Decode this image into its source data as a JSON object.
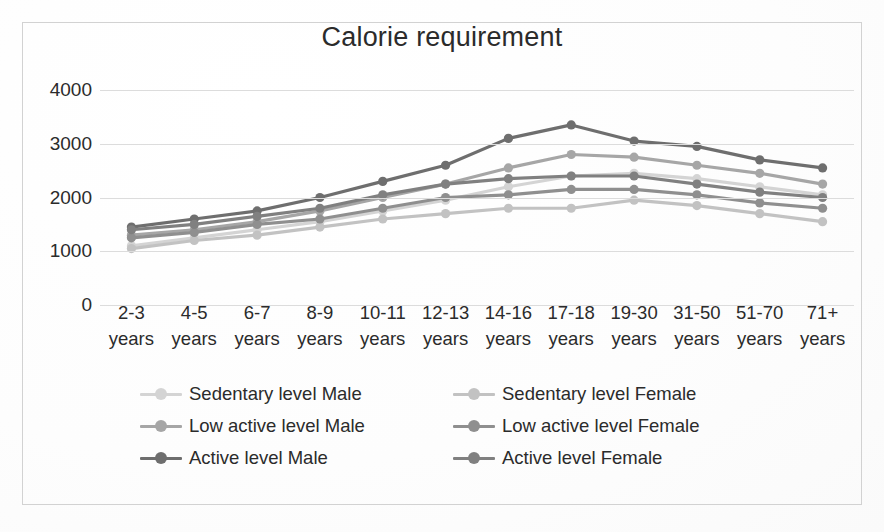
{
  "chart_title": "Calorie requirement",
  "axis": {
    "y_ticks": [
      "4000",
      "3000",
      "2000",
      "1000",
      "0"
    ],
    "x_categories": [
      {
        "l1": "2-3",
        "l2": "years"
      },
      {
        "l1": "4-5",
        "l2": "years"
      },
      {
        "l1": "6-7",
        "l2": "years"
      },
      {
        "l1": "8-9",
        "l2": "years"
      },
      {
        "l1": "10-11",
        "l2": "years"
      },
      {
        "l1": "12-13",
        "l2": "years"
      },
      {
        "l1": "14-16",
        "l2": "years"
      },
      {
        "l1": "17-18",
        "l2": "years"
      },
      {
        "l1": "19-30",
        "l2": "years"
      },
      {
        "l1": "31-50",
        "l2": "years"
      },
      {
        "l1": "51-70",
        "l2": "years"
      },
      {
        "l1": "71+",
        "l2": "years"
      }
    ]
  },
  "legend": {
    "position": "bottom",
    "items": [
      {
        "label": "Sedentary level Male",
        "color": "#d4d4d4"
      },
      {
        "label": "Sedentary level Female",
        "color": "#c2c2c2"
      },
      {
        "label": "Low active level Male",
        "color": "#a6a6a6"
      },
      {
        "label": "Low active level Female",
        "color": "#8f8f8f"
      },
      {
        "label": "Active level Male",
        "color": "#6e6e6e"
      },
      {
        "label": "Active level Female",
        "color": "#808080"
      }
    ]
  },
  "chart_data": {
    "type": "line",
    "title": "Calorie requirement",
    "xlabel": "",
    "ylabel": "",
    "ylim": [
      0,
      4000
    ],
    "ytick_step": 1000,
    "grid": true,
    "legend_position": "bottom",
    "markers": true,
    "categories": [
      "2-3 years",
      "4-5 years",
      "6-7 years",
      "8-9 years",
      "10-11 years",
      "12-13 years",
      "14-16 years",
      "17-18 years",
      "19-30 years",
      "31-50 years",
      "51-70 years",
      "71+ years"
    ],
    "series": [
      {
        "name": "Sedentary level Male",
        "color": "#d4d4d4",
        "values": [
          1100,
          1250,
          1400,
          1550,
          1750,
          1950,
          2200,
          2400,
          2450,
          2350,
          2200,
          2050
        ]
      },
      {
        "name": "Sedentary level Female",
        "color": "#c2c2c2",
        "values": [
          1050,
          1200,
          1300,
          1450,
          1600,
          1700,
          1800,
          1800,
          1950,
          1850,
          1700,
          1550
        ]
      },
      {
        "name": "Low active level Male",
        "color": "#a6a6a6",
        "values": [
          1300,
          1400,
          1550,
          1750,
          2000,
          2250,
          2550,
          2800,
          2750,
          2600,
          2450,
          2250
        ]
      },
      {
        "name": "Low active level Female",
        "color": "#8f8f8f",
        "values": [
          1250,
          1350,
          1500,
          1600,
          1800,
          2000,
          2050,
          2150,
          2150,
          2050,
          1900,
          1800
        ]
      },
      {
        "name": "Active level Male",
        "color": "#6e6e6e",
        "values": [
          1450,
          1600,
          1750,
          2000,
          2300,
          2600,
          3100,
          3350,
          3050,
          2950,
          2700,
          2550
        ]
      },
      {
        "name": "Active level Female",
        "color": "#808080",
        "values": [
          1400,
          1500,
          1650,
          1800,
          2050,
          2250,
          2350,
          2400,
          2400,
          2250,
          2100,
          2000
        ]
      }
    ]
  }
}
